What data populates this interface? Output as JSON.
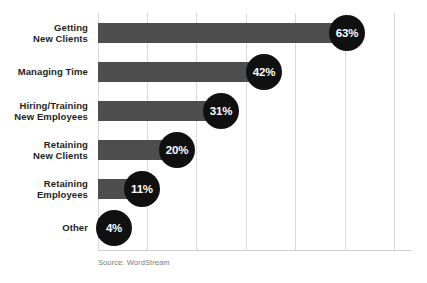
{
  "chart_data": {
    "type": "bar",
    "orientation": "horizontal",
    "title": "",
    "xlabel": "",
    "ylabel": "",
    "categories": [
      "Getting\nNew Clients",
      "Managing Time",
      "Hiring/Training\nNew Employees",
      "Retaining\nNew Clients",
      "Retaining\nEmployees",
      "Other"
    ],
    "values": [
      63,
      42,
      31,
      20,
      11,
      4
    ],
    "value_labels": [
      "63%",
      "42%",
      "31%",
      "20%",
      "11%",
      "4%"
    ],
    "xlim": [
      0,
      75
    ],
    "gridlines": [
      0,
      12.5,
      25,
      37.5,
      50,
      62.5,
      75
    ],
    "grid": true,
    "legend": null,
    "bar_color": "#4d4d4d",
    "badge_color": "#101010",
    "badge_text_color": "#ffffff",
    "gridline_color": "#d9d9d9",
    "label_color": "#231f20",
    "background": "#ffffff"
  },
  "source_note": "Source: WordStream",
  "cropped_title": ""
}
